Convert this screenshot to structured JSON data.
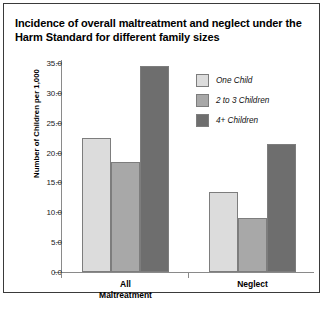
{
  "chart_data": {
    "type": "bar",
    "title": "Incidence of overall maltreatment and neglect under the Harm Standard for different family sizes",
    "xlabel": "",
    "ylabel": "Number of Children per 1,000",
    "categories": [
      "All Maltreatment",
      "Neglect"
    ],
    "category_lines": [
      [
        "All",
        "Maltreatment"
      ],
      [
        "Neglect"
      ]
    ],
    "series": [
      {
        "name": "One Child",
        "values": [
          22.4,
          13.4
        ],
        "color": "#dcdcdc"
      },
      {
        "name": "2 to 3 Children",
        "values": [
          18.4,
          9.0
        ],
        "color": "#a8a8a8"
      },
      {
        "name": "4+ Children",
        "values": [
          34.5,
          21.4
        ],
        "color": "#6e6e6e"
      }
    ],
    "ylim": [
      0.0,
      35.0
    ],
    "ytick_values": [
      0.0,
      5.0,
      10.0,
      15.0,
      20.0,
      25.0,
      30.0,
      35.0
    ],
    "ytick_labels": [
      "0.0",
      "5.0",
      "10.0",
      "15.0",
      "20.0",
      "25.0",
      "30.0",
      "35.0"
    ],
    "grid": false,
    "legend_position": "upper right"
  },
  "legend": {
    "items": [
      {
        "label": "One Child"
      },
      {
        "label": "2 to 3 Children"
      },
      {
        "label": "4+ Children"
      }
    ]
  },
  "caption": {
    "text": ""
  }
}
